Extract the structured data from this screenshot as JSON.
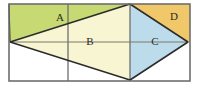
{
  "figure": {
    "type": "geometry-diagram",
    "canvas": {
      "width": 200,
      "height": 86,
      "background": "#ffffff"
    },
    "rect": {
      "name": "outer-rectangle",
      "left": 9,
      "top": 4,
      "right": 190,
      "bottom": 81,
      "stroke": "#6e6e6e",
      "fill": "#ffffff",
      "stroke_width": 1.6
    },
    "vertical_lines": [
      {
        "name": "vertical-divider-left",
        "x": 68,
        "y1": 4,
        "y2": 81,
        "stroke": "#6e6e6e"
      },
      {
        "name": "vertical-divider-right",
        "x": 130,
        "y1": 4,
        "y2": 81,
        "stroke": "#6e6e6e"
      }
    ],
    "horizontal_line": {
      "name": "horizontal-midline",
      "x1": 10,
      "x2": 189,
      "y": 42,
      "stroke": "#7a7a6a"
    },
    "points": {
      "top_left": [
        9,
        4
      ],
      "top_right": [
        190,
        4
      ],
      "bottom_left": [
        9,
        81
      ],
      "bottom_right": [
        190,
        81
      ],
      "left_mid": [
        10,
        42
      ],
      "right_mid": [
        188,
        42
      ],
      "top_apex": [
        130,
        4
      ],
      "bottom_apex": [
        130,
        80
      ]
    },
    "regions": [
      {
        "id": "A",
        "name": "region-a-green",
        "label": "A",
        "fill": "#c6d972",
        "label_x": 60,
        "label_y": 18,
        "polygon": "9,4 130,4 10,42 9,42"
      },
      {
        "id": "B",
        "name": "region-b-pale-yellow",
        "label": "B",
        "fill": "#f7f5d2",
        "label_x": 90,
        "label_y": 42,
        "polygon": "10,42 130,4 130,80"
      },
      {
        "id": "C",
        "name": "region-c-blue",
        "label": "C",
        "fill": "#bcdcec",
        "label_x": 155,
        "label_y": 42,
        "polygon": "130,4 188,42 130,80"
      },
      {
        "id": "D",
        "name": "region-d-orange",
        "label": "D",
        "fill": "#f0c86a",
        "label_x": 174,
        "label_y": 17,
        "polygon": "130,4 190,4 190,42 188,42"
      }
    ],
    "diagonals": [
      {
        "name": "diagonal-top-left-to-apex",
        "x1": 10,
        "y1": 42,
        "x2": 130,
        "y2": 4
      },
      {
        "name": "diagonal-apex-to-right-mid",
        "x1": 130,
        "y1": 4,
        "x2": 188,
        "y2": 42
      },
      {
        "name": "diagonal-right-mid-to-bottom-apex",
        "x1": 188,
        "y1": 42,
        "x2": 130,
        "y2": 80
      },
      {
        "name": "diagonal-bottom-apex-to-left-mid",
        "x1": 130,
        "y1": 80,
        "x2": 10,
        "y2": 42
      },
      {
        "name": "diagonal-top-left-corner-to-left-mid",
        "x1": 9,
        "y1": 4,
        "x2": 10,
        "y2": 42
      }
    ],
    "label_color": "#2a2a2a",
    "edge_stroke": "#2b2b2b"
  }
}
